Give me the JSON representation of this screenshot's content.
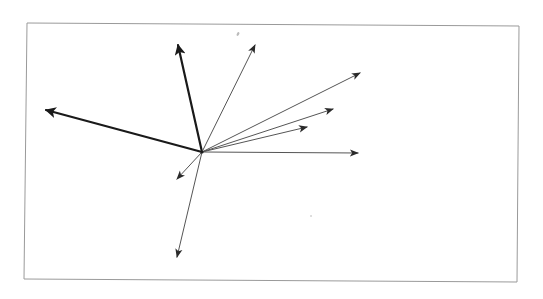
{
  "diagram": {
    "type": "vector-diagram",
    "frame": {
      "corners": [
        [
          27,
          23
        ],
        [
          519,
          26
        ],
        [
          517,
          282
        ],
        [
          24,
          279
        ]
      ],
      "stroke": "#9a9a9a"
    },
    "origin": [
      202,
      152
    ],
    "colors": {
      "bold": "#1a1a1a",
      "thin": "#555555",
      "background": "#ffffff"
    },
    "vectors": [
      {
        "id": "v1",
        "label": "",
        "tip": [
          46,
          110
        ],
        "weight": "bold"
      },
      {
        "id": "v2",
        "label": "",
        "tip": [
          178,
          45
        ],
        "weight": "bold"
      },
      {
        "id": "v3",
        "label": "",
        "tip": [
          255,
          45
        ],
        "weight": "thin"
      },
      {
        "id": "v4",
        "label": "",
        "tip": [
          360,
          73
        ],
        "weight": "thin"
      },
      {
        "id": "v5",
        "label": "",
        "tip": [
          333,
          109
        ],
        "weight": "thin"
      },
      {
        "id": "v6",
        "label": "",
        "tip": [
          307,
          127
        ],
        "weight": "thin"
      },
      {
        "id": "v7",
        "label": "",
        "tip": [
          358,
          153
        ],
        "weight": "thin"
      },
      {
        "id": "v8",
        "label": "",
        "tip": [
          177,
          179
        ],
        "weight": "thin"
      },
      {
        "id": "v9",
        "label": "",
        "tip": [
          177,
          257
        ],
        "weight": "thin"
      }
    ],
    "marks": [
      {
        "id": "smudge-top",
        "at": [
          238,
          34
        ]
      },
      {
        "id": "speck",
        "at": [
          311,
          216
        ]
      }
    ]
  }
}
